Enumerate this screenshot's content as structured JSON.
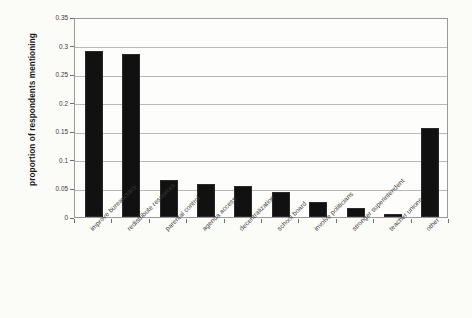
{
  "chart_data": {
    "type": "bar",
    "title": "",
    "subtitle": "",
    "xlabel": "",
    "ylabel": "proportion of respondents mentioning",
    "ylim": [
      0,
      0.35
    ],
    "ytick_values": [
      0,
      0.05,
      0.1,
      0.15,
      0.2,
      0.25,
      0.3,
      0.35
    ],
    "ytick_labels": [
      "0",
      "0.05",
      "0.1",
      "0.15",
      "0.2",
      "0.25",
      "0.3",
      "0.35"
    ],
    "grid": true,
    "legend": "none",
    "bar_color": "#111111",
    "categories": [
      "improve bureaucracy",
      "redistribute resources",
      "parental control",
      "agenda access",
      "decentralization",
      "school board",
      "involve politicians",
      "stronger superintendent",
      "teacher unions",
      "other"
    ],
    "values": [
      0.291,
      0.285,
      0.065,
      0.057,
      0.054,
      0.043,
      0.026,
      0.015,
      0.006,
      0.156
    ]
  }
}
